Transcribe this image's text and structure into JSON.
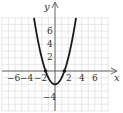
{
  "chart_data": {
    "type": "line",
    "title": "",
    "xlabel": "x",
    "ylabel": "y",
    "xlim": [
      -8,
      8
    ],
    "ylim": [
      -6,
      8
    ],
    "grid": true,
    "x_ticks": [
      -6,
      -4,
      -2,
      2,
      4,
      6
    ],
    "y_ticks": [
      6,
      4,
      2,
      -4
    ],
    "x_tick_labels": [
      "−6",
      "−4",
      "−2",
      "2",
      "4",
      "6"
    ],
    "y_tick_labels": [
      "6",
      "4",
      "2",
      "−4"
    ],
    "series": [
      {
        "name": "y = x^2 - 2",
        "function": "x^2 - 2",
        "vertex": [
          0,
          -2
        ],
        "x_intercepts": [
          -1.414,
          1.414
        ],
        "x": [
          -3.1,
          -3,
          -2.5,
          -2,
          -1.5,
          -1.414,
          -1,
          -0.5,
          0,
          0.5,
          1,
          1.414,
          1.5,
          2,
          2.5,
          3,
          3.1
        ],
        "y": [
          7.61,
          7,
          4.25,
          2,
          0.25,
          0,
          -1,
          -1.75,
          -2,
          -1.75,
          -1,
          0,
          0.25,
          2,
          4.25,
          7,
          7.61
        ]
      }
    ],
    "points": [
      {
        "x": -1.414,
        "y": 0
      },
      {
        "x": 1.414,
        "y": 0
      }
    ],
    "colors": {
      "curve": "#1a1a1a",
      "grid": "#d8d8d8",
      "axis": "#555555"
    }
  },
  "labels": {
    "x_axis": "x",
    "y_axis": "y",
    "xt": [
      "−6",
      "−4",
      "−2",
      "2",
      "4",
      "6"
    ],
    "yt": [
      "6",
      "4",
      "2",
      "−4"
    ]
  }
}
